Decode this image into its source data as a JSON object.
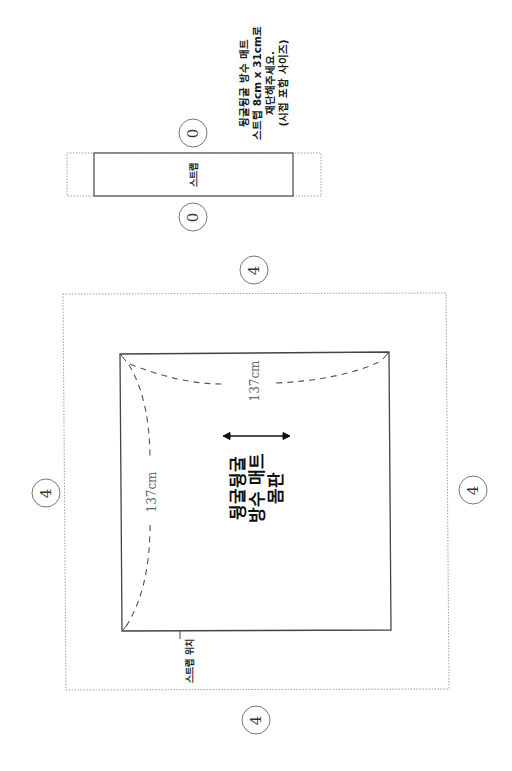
{
  "diagram": {
    "type": "sewing-pattern",
    "orientation": "rotated-90-ccw",
    "colors": {
      "solid_line": "#444444",
      "dotted_line": "#9a9a9a",
      "dashed_curve": "#555555",
      "text": "#111111",
      "dim_text": "#666666"
    },
    "note": {
      "lines": [
        "뒹굴뒹굴 방수 매트",
        "스트랩 8cm x 31cm로",
        "재단해주세요.",
        "(시접 포함 사이즈)"
      ]
    },
    "strap_piece": {
      "label": "스트랩",
      "seam_allowance_top": "0",
      "seam_allowance_bottom": "0"
    },
    "body_piece": {
      "label_lines": [
        "뒹굴뒹굴",
        "방수 매트",
        "몸판"
      ],
      "width_label": "137cm",
      "height_label": "137cm",
      "grainline": "double-arrow",
      "strap_position_label": "스트랩 위치",
      "seam_allowances": {
        "top": "4",
        "left": "4",
        "right": "4",
        "bottom": "4"
      }
    }
  }
}
